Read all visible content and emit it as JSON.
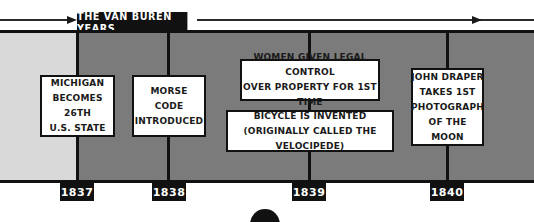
{
  "header": {
    "title": "THE VAN BUREN YEARS"
  },
  "timeline": {
    "years": [
      "1837",
      "1838",
      "1839",
      "1840"
    ],
    "events": [
      {
        "year": "1837",
        "text": "MICHIGAN\nBECOMES 26TH\nU.S. STATE"
      },
      {
        "year": "1838",
        "text": "MORSE\nCODE\nINTRODUCED"
      },
      {
        "year": "1839",
        "text": "WOMEN GIVEN LEGAL CONTROL\nOVER PROPERTY FOR 1ST TIME"
      },
      {
        "year": "1839",
        "text": "BICYCLE IS INVENTED\n(ORIGINALLY CALLED THE VELOCIPEDE)"
      },
      {
        "year": "1840",
        "text": "JOHN DRAPER\nTAKES 1ST\nPHOTOGRAPH\nOF THE MOON"
      }
    ]
  },
  "colors": {
    "pre_term_band": "#d9d9d9",
    "term_band": "#7b7b7b",
    "badge": "#111111"
  }
}
